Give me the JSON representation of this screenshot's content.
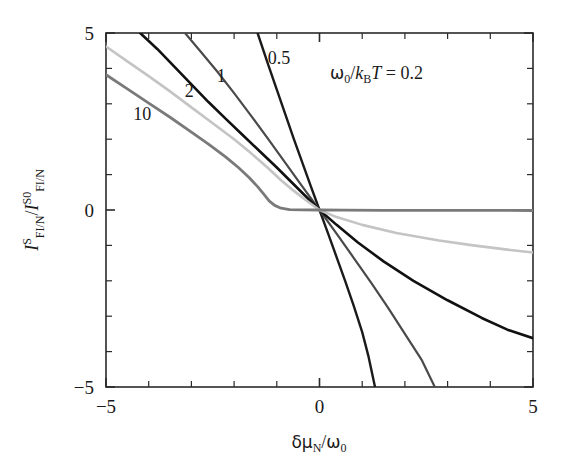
{
  "chart_data": {
    "type": "line",
    "title": "",
    "xlabel": "δμ_N/ω_0",
    "ylabel": "I^S_{FI/N} / I^{S0}_{FI/N}",
    "xlim": [
      -5,
      5
    ],
    "ylim": [
      -5,
      5
    ],
    "xticks_major": [
      -5,
      0,
      5
    ],
    "yticks_major": [
      -5,
      0,
      5
    ],
    "xtick_labels": [
      "−5",
      "0",
      "5"
    ],
    "ytick_labels": [
      "−5",
      "0",
      "5"
    ],
    "minor_tick_step": 1,
    "grid": false,
    "legend": "inline-curve-labels",
    "annotation": "ω₀/k_B T = 0.2",
    "series": [
      {
        "name": "0.5",
        "label": "0.5",
        "color": "#1a1a1a",
        "width": 2.4,
        "label_x": -0.85,
        "label_y": 4.05,
        "points": [
          [
            -1.45,
            5.0
          ],
          [
            -1.2,
            4.1
          ],
          [
            -1.0,
            3.4
          ],
          [
            -0.8,
            2.7
          ],
          [
            -0.6,
            2.0
          ],
          [
            -0.4,
            1.33
          ],
          [
            -0.2,
            0.66
          ],
          [
            0,
            0
          ],
          [
            0.2,
            -0.66
          ],
          [
            0.4,
            -1.33
          ],
          [
            0.6,
            -2.0
          ],
          [
            0.8,
            -2.7
          ],
          [
            1.0,
            -3.45
          ],
          [
            1.15,
            -4.15
          ],
          [
            1.3,
            -5.0
          ]
        ]
      },
      {
        "name": "1",
        "label": "1",
        "color": "#4a4a4a",
        "width": 2.2,
        "label_x": -2.2,
        "label_y": 3.55,
        "points": [
          [
            -3.15,
            5.0
          ],
          [
            -2.8,
            4.5
          ],
          [
            -2.4,
            3.92
          ],
          [
            -2.0,
            3.3
          ],
          [
            -1.6,
            2.66
          ],
          [
            -1.2,
            2.0
          ],
          [
            -0.8,
            1.33
          ],
          [
            -0.4,
            0.66
          ],
          [
            0,
            0
          ],
          [
            0.4,
            -0.67
          ],
          [
            0.8,
            -1.35
          ],
          [
            1.2,
            -2.04
          ],
          [
            1.6,
            -2.75
          ],
          [
            2.0,
            -3.5
          ],
          [
            2.4,
            -4.25
          ],
          [
            2.7,
            -5.0
          ]
        ]
      },
      {
        "name": "1-dark",
        "label": "1",
        "color": "#111111",
        "width": 2.6,
        "label_x": -3.05,
        "label_y": 3.6,
        "points": [
          [
            -4.2,
            5.0
          ],
          [
            -3.8,
            4.55
          ],
          [
            -3.4,
            4.05
          ],
          [
            -3.0,
            3.55
          ],
          [
            -2.6,
            3.05
          ],
          [
            -2.2,
            2.58
          ],
          [
            -1.8,
            2.12
          ],
          [
            -1.4,
            1.66
          ],
          [
            -1.0,
            1.2
          ],
          [
            -0.6,
            0.72
          ],
          [
            -0.3,
            0.36
          ],
          [
            0,
            0
          ],
          [
            0.4,
            -0.42
          ],
          [
            0.9,
            -0.92
          ],
          [
            1.5,
            -1.45
          ],
          [
            2.2,
            -2.0
          ],
          [
            3.0,
            -2.55
          ],
          [
            3.8,
            -3.05
          ],
          [
            4.4,
            -3.38
          ],
          [
            5.0,
            -3.62
          ]
        ]
      },
      {
        "name": "2",
        "label": "2",
        "color": "#c4c4c4",
        "width": 2.6,
        "label_x": -3.7,
        "label_y": 3.25,
        "points": [
          [
            -5.0,
            4.62
          ],
          [
            -4.5,
            4.2
          ],
          [
            -4.0,
            3.78
          ],
          [
            -3.5,
            3.35
          ],
          [
            -3.0,
            2.9
          ],
          [
            -2.5,
            2.45
          ],
          [
            -2.0,
            2.0
          ],
          [
            -1.6,
            1.6
          ],
          [
            -1.2,
            1.18
          ],
          [
            -0.9,
            0.84
          ],
          [
            -0.6,
            0.54
          ],
          [
            -0.3,
            0.26
          ],
          [
            0,
            0
          ],
          [
            0.4,
            -0.2
          ],
          [
            1.0,
            -0.42
          ],
          [
            1.8,
            -0.65
          ],
          [
            2.8,
            -0.86
          ],
          [
            3.6,
            -1.0
          ],
          [
            4.4,
            -1.12
          ],
          [
            5.0,
            -1.2
          ]
        ]
      },
      {
        "name": "10",
        "label": "10",
        "color": "#7a7a7a",
        "width": 2.8,
        "label_x": -4.15,
        "label_y": 2.55,
        "points": [
          [
            -5.0,
            3.82
          ],
          [
            -4.5,
            3.42
          ],
          [
            -4.0,
            3.02
          ],
          [
            -3.5,
            2.62
          ],
          [
            -3.0,
            2.2
          ],
          [
            -2.6,
            1.86
          ],
          [
            -2.2,
            1.5
          ],
          [
            -1.9,
            1.2
          ],
          [
            -1.65,
            0.92
          ],
          [
            -1.45,
            0.66
          ],
          [
            -1.3,
            0.44
          ],
          [
            -1.18,
            0.26
          ],
          [
            -1.05,
            0.13
          ],
          [
            -0.9,
            0.05
          ],
          [
            -0.7,
            0.012
          ],
          [
            -0.4,
            0.002
          ],
          [
            0,
            0
          ],
          [
            0.6,
            -0.004
          ],
          [
            1.5,
            -0.008
          ],
          [
            2.5,
            -0.01
          ],
          [
            3.5,
            -0.012
          ],
          [
            5.0,
            -0.014
          ]
        ]
      }
    ],
    "curve_labels": [
      {
        "text": "10",
        "x": -4.15,
        "y": 2.55
      },
      {
        "text": "2",
        "x": -3.05,
        "y": 3.2
      },
      {
        "text": "1",
        "x": -2.3,
        "y": 3.62
      },
      {
        "text": "0.5",
        "x": -0.95,
        "y": 4.12
      }
    ],
    "annotation_pos": {
      "x": 0.55,
      "y": 4.12
    }
  }
}
